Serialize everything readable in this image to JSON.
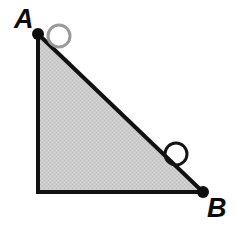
{
  "figure": {
    "kind": "geometry-diagram",
    "canvas": {
      "width": 236,
      "height": 228
    },
    "background_color": "#ffffff"
  },
  "colors": {
    "background": "#ffffff",
    "triangle_fill": "#c9c9c9",
    "triangle_fill_light": "#d6d6d6",
    "triangle_stroke": "#111111",
    "vertex_dot": "#0d0d0d",
    "circle_a_stroke": "#9a9a9a",
    "circle_hypotenuse_stroke": "#141414",
    "label_color": "#0a0a0a"
  },
  "triangle": {
    "name": "right-triangle",
    "fill": "#c9c9c9",
    "stroke": "#111111",
    "stroke_width": 4,
    "points": "38,34 38,192 203,192",
    "vertices": [
      {
        "id": "A",
        "x": 38,
        "y": 34,
        "role": "apex-top-left"
      },
      {
        "id": "C",
        "x": 38,
        "y": 192,
        "role": "right-angle-bottom-left"
      },
      {
        "id": "B",
        "x": 203,
        "y": 192,
        "role": "bottom-right"
      }
    ],
    "edges": [
      {
        "id": "leg-vertical",
        "from": "A",
        "to": "C"
      },
      {
        "id": "leg-horizontal",
        "from": "C",
        "to": "B"
      },
      {
        "id": "hypotenuse",
        "from": "A",
        "to": "B"
      }
    ]
  },
  "vertex_dots": [
    {
      "id": "dot-a",
      "cx": 38,
      "cy": 34,
      "r": 6,
      "fill": "#0d0d0d"
    },
    {
      "id": "dot-b",
      "cx": 203,
      "cy": 192,
      "r": 6,
      "fill": "#0d0d0d"
    }
  ],
  "circle_markers": [
    {
      "id": "circle-near-a",
      "cx": 59,
      "cy": 36,
      "r": 11,
      "stroke": "#9a9a9a",
      "stroke_width": 3,
      "fill": "none"
    },
    {
      "id": "circle-on-hypotenuse",
      "cx": 176,
      "cy": 154,
      "r": 11,
      "stroke": "#141414",
      "stroke_width": 3,
      "fill": "none"
    }
  ],
  "labels": {
    "vertex_a": {
      "text": "A",
      "x": 14,
      "y": 28,
      "font_size": 27
    },
    "vertex_b": {
      "text": "B",
      "x": 207,
      "y": 217,
      "font_size": 27
    }
  }
}
